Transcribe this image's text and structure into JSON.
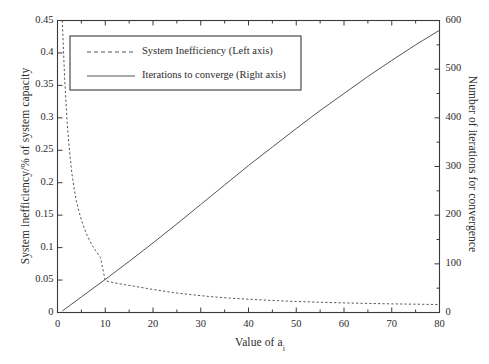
{
  "chart_data": {
    "type": "line",
    "title": "",
    "xlabel": "Value of a",
    "xlabel_subscript": "i",
    "ylabel": "System inefficiency/% of system capacity",
    "ylabel_right": "Number of iterations for convergence",
    "grid": false,
    "legend_position": "upper-left",
    "xlim": [
      0,
      80
    ],
    "ylim_left": [
      0,
      0.45
    ],
    "ylim_right": [
      0,
      600
    ],
    "xticks": [
      0,
      10,
      20,
      30,
      40,
      50,
      60,
      70,
      80
    ],
    "xtick_labels": [
      "0",
      "10",
      "20",
      "30",
      "40",
      "50",
      "60",
      "70",
      "80"
    ],
    "yticks_left": [
      0,
      0.05,
      0.1,
      0.15,
      0.2,
      0.25,
      0.3,
      0.35,
      0.4,
      0.45
    ],
    "ytick_labels_left": [
      "0",
      "0.05",
      "0.1",
      "0.15",
      "0.2",
      "0.25",
      "0.3",
      "0.35",
      "0.4",
      "0.45"
    ],
    "yticks_right": [
      0,
      100,
      200,
      300,
      400,
      500,
      600
    ],
    "ytick_labels_right": [
      "0",
      "100",
      "200",
      "300",
      "400",
      "500",
      "600"
    ],
    "series": [
      {
        "name": "System Inefficiency (Left axis)",
        "axis": "left",
        "style": "dashed",
        "color": "#555555",
        "x": [
          1,
          1.5,
          2,
          2.5,
          3,
          3.5,
          4,
          5,
          6,
          7,
          8,
          9,
          10,
          12,
          14,
          16,
          18,
          20,
          24,
          28,
          32,
          36,
          40,
          45,
          50,
          55,
          60,
          65,
          70,
          75,
          80
        ],
        "y": [
          0.45,
          0.36,
          0.295,
          0.25,
          0.215,
          0.19,
          0.17,
          0.142,
          0.122,
          0.107,
          0.095,
          0.085,
          0.049,
          0.0455,
          0.043,
          0.0405,
          0.038,
          0.0355,
          0.031,
          0.0275,
          0.0245,
          0.0222,
          0.0205,
          0.0185,
          0.017,
          0.0158,
          0.0148,
          0.014,
          0.0133,
          0.0128,
          0.0123
        ]
      },
      {
        "name": "Iterations to converge (Right axis)",
        "axis": "right",
        "style": "solid",
        "color": "#555555",
        "x": [
          1,
          5,
          10,
          15,
          20,
          25,
          30,
          35,
          40,
          45,
          50,
          55,
          60,
          65,
          70,
          75,
          80
        ],
        "y": [
          3,
          32,
          68,
          105,
          143,
          182,
          222,
          262,
          302,
          340,
          378,
          415,
          450,
          485,
          518,
          550,
          580
        ]
      }
    ]
  },
  "legend": {
    "items": [
      {
        "label": "System Inefficiency (Left axis)",
        "style": "dashed"
      },
      {
        "label": "Iterations to converge (Right axis)",
        "style": "solid"
      }
    ]
  },
  "axes": {
    "left_title": "System inefficiency/% of system capacity",
    "right_title": "Number of iterations for convergence",
    "x_title_main": "Value of a",
    "x_title_sub": "i"
  },
  "colors": {
    "line": "#555555",
    "axis": "#3a3a3a",
    "background": "#ffffff",
    "text": "#2b2b2b"
  }
}
